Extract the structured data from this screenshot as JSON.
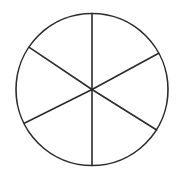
{
  "diagram": {
    "type": "circle-divided-into-sectors",
    "sector_count": 6,
    "stroke_color": "#2b2b2b",
    "background_color": "#ffffff",
    "circle": {
      "cx": 92,
      "cy": 89.5,
      "r": 76
    },
    "spokes": [
      {
        "name": "spoke-top",
        "x2": 92,
        "y2": 13.5
      },
      {
        "name": "spoke-upper-right",
        "x2": 158.7,
        "y2": 53.3
      },
      {
        "name": "spoke-lower-right",
        "x2": 156.7,
        "y2": 130
      },
      {
        "name": "spoke-bottom",
        "x2": 92,
        "y2": 165.5
      },
      {
        "name": "spoke-lower-left",
        "x2": 24.3,
        "y2": 123.3
      },
      {
        "name": "spoke-upper-left",
        "x2": 29.3,
        "y2": 47.3
      }
    ]
  }
}
